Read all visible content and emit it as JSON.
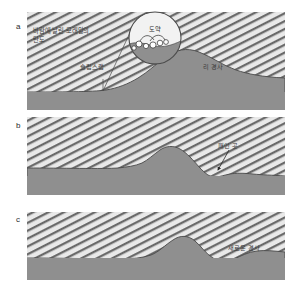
{
  "figure": {
    "background_color": "#ffffff",
    "sand_fill_color": "#d8d8d8",
    "substrate_color": "#8f8f8f",
    "hatch_color": "#5a5a5a",
    "outline_color": "#4a4a4a",
    "label_color": "#3a3a3a"
  },
  "panels": [
    {
      "letter": "a",
      "labels": [
        {
          "name": "saltation-trajectory-label",
          "text": "바람에 날린 모래알의\n탄도",
          "x": 33,
          "y": 28
        },
        {
          "name": "slip-face-label",
          "text": "슬립스랩",
          "x": 80,
          "y": 64
        },
        {
          "name": "lee-slope-label",
          "text": "리 경사",
          "x": 203,
          "y": 64
        }
      ],
      "inset": {
        "name": "saltation-inset",
        "label": "도약",
        "cx": 155,
        "cy": 38,
        "r": 26
      }
    },
    {
      "letter": "b",
      "labels": [
        {
          "name": "scour-pit-label",
          "text": "패인 곳",
          "x": 215,
          "y": 143
        }
      ]
    },
    {
      "letter": "c",
      "labels": [
        {
          "name": "new-slope-label",
          "text": "새로운 경사",
          "x": 228,
          "y": 245
        }
      ]
    }
  ]
}
